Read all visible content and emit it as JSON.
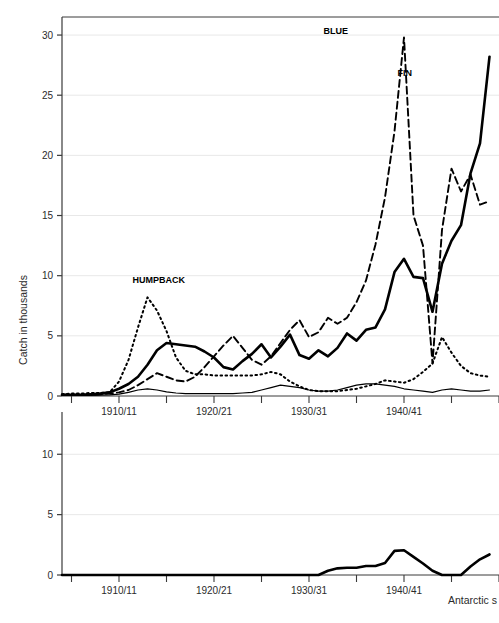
{
  "chart_data": {
    "type": "line",
    "title": "",
    "xlabel": "Antarctic s",
    "ylabel": "Catch in thousands",
    "grid": true,
    "legend_position": "inline-annotations",
    "panels": [
      {
        "name": "upper-panel",
        "ylim": [
          0,
          31.5
        ],
        "yticks": [
          0,
          5,
          10,
          15,
          20,
          25,
          30
        ],
        "ytick_labels": [
          "0",
          "5",
          "10",
          "15",
          "20",
          "25",
          "30"
        ],
        "xlim": [
          1904,
          1950
        ],
        "xticks": [
          1905,
          1910,
          1915,
          1920,
          1925,
          1930,
          1935,
          1940,
          1945,
          1950
        ],
        "xtick_labels": [
          "",
          "1910/11",
          "",
          "1920/21",
          "",
          "1930/31",
          "",
          "1940/41",
          "",
          ""
        ],
        "annotations": [
          {
            "text": "HUMPBACK",
            "x": 1911.0,
            "y": 9.4
          },
          {
            "text": "BLUE",
            "x": 1931.1,
            "y": 30.1
          },
          {
            "text": "FIN",
            "x": 1938.9,
            "y": 26.6
          }
        ],
        "series": [
          {
            "name": "BLUE",
            "style": "dashed",
            "x": [
              1904,
              1905,
              1906,
              1907,
              1908,
              1909,
              1910,
              1911,
              1912,
              1913,
              1914,
              1915,
              1916,
              1917,
              1918,
              1919,
              1920,
              1921,
              1922,
              1923,
              1924,
              1925,
              1926,
              1927,
              1928,
              1929,
              1930,
              1931,
              1932,
              1933,
              1934,
              1935,
              1936,
              1937,
              1938,
              1939,
              1940,
              1941,
              1942,
              1943,
              1944,
              1945,
              1946,
              1947,
              1948,
              1949
            ],
            "values": [
              0.1,
              0.1,
              0.1,
              0.1,
              0.15,
              0.2,
              0.3,
              0.5,
              0.9,
              1.4,
              1.9,
              1.6,
              1.3,
              1.2,
              1.6,
              2.4,
              3.3,
              4.2,
              5.0,
              4.0,
              3.0,
              2.6,
              3.3,
              4.4,
              5.5,
              6.3,
              4.9,
              5.3,
              6.5,
              6.0,
              6.5,
              7.8,
              9.6,
              12.6,
              16.5,
              22.0,
              29.8,
              15.0,
              12.5,
              2.7,
              13.8,
              18.9,
              17.0,
              18.4,
              15.9,
              16.2
            ]
          },
          {
            "name": "FIN",
            "style": "solid-thick",
            "x": [
              1904,
              1905,
              1906,
              1907,
              1908,
              1909,
              1910,
              1911,
              1912,
              1913,
              1914,
              1915,
              1916,
              1917,
              1918,
              1919,
              1920,
              1921,
              1922,
              1923,
              1924,
              1925,
              1926,
              1927,
              1928,
              1929,
              1930,
              1931,
              1932,
              1933,
              1934,
              1935,
              1936,
              1937,
              1938,
              1939,
              1940,
              1941,
              1942,
              1943,
              1944,
              1945,
              1946,
              1947,
              1948,
              1949
            ],
            "values": [
              0.1,
              0.1,
              0.1,
              0.15,
              0.2,
              0.3,
              0.6,
              1.0,
              1.6,
              2.6,
              3.8,
              4.4,
              4.3,
              4.2,
              4.1,
              3.7,
              3.2,
              2.4,
              2.2,
              2.9,
              3.5,
              4.3,
              3.2,
              4.1,
              5.1,
              3.4,
              3.1,
              3.8,
              3.3,
              4.0,
              5.2,
              4.6,
              5.5,
              5.7,
              7.2,
              10.3,
              11.4,
              9.9,
              9.8,
              7.0,
              11.0,
              12.9,
              14.2,
              18.5,
              21.0,
              28.2
            ]
          },
          {
            "name": "HUMPBACK",
            "style": "dotted",
            "x": [
              1904,
              1905,
              1906,
              1907,
              1908,
              1909,
              1910,
              1911,
              1912,
              1913,
              1914,
              1915,
              1916,
              1917,
              1918,
              1919,
              1920,
              1921,
              1922,
              1923,
              1924,
              1925,
              1926,
              1927,
              1928,
              1929,
              1930,
              1931,
              1932,
              1933,
              1934,
              1935,
              1936,
              1937,
              1938,
              1939,
              1940,
              1941,
              1942,
              1943,
              1944,
              1945,
              1946,
              1947,
              1948,
              1949
            ],
            "values": [
              0.15,
              0.2,
              0.2,
              0.25,
              0.25,
              0.3,
              1.2,
              3.0,
              5.7,
              8.2,
              7.1,
              5.4,
              3.2,
              2.1,
              1.8,
              1.8,
              1.7,
              1.7,
              1.7,
              1.7,
              1.7,
              1.8,
              2.0,
              1.8,
              1.2,
              0.8,
              0.5,
              0.4,
              0.4,
              0.4,
              0.5,
              0.6,
              0.8,
              1.0,
              1.3,
              1.2,
              1.1,
              1.4,
              2.0,
              2.7,
              4.9,
              3.6,
              2.5,
              1.9,
              1.7,
              1.6
            ]
          },
          {
            "name": "OTHER",
            "style": "solid-thin",
            "x": [
              1904,
              1905,
              1906,
              1907,
              1908,
              1909,
              1910,
              1911,
              1912,
              1913,
              1914,
              1915,
              1916,
              1917,
              1918,
              1919,
              1920,
              1921,
              1922,
              1923,
              1924,
              1925,
              1926,
              1927,
              1928,
              1929,
              1930,
              1931,
              1932,
              1933,
              1934,
              1935,
              1936,
              1937,
              1938,
              1939,
              1940,
              1941,
              1942,
              1943,
              1944,
              1945,
              1946,
              1947,
              1948,
              1949
            ],
            "values": [
              0.05,
              0.05,
              0.05,
              0.05,
              0.08,
              0.1,
              0.15,
              0.3,
              0.5,
              0.6,
              0.5,
              0.35,
              0.25,
              0.2,
              0.2,
              0.2,
              0.2,
              0.2,
              0.2,
              0.25,
              0.3,
              0.5,
              0.7,
              0.9,
              0.8,
              0.7,
              0.5,
              0.4,
              0.4,
              0.5,
              0.7,
              0.9,
              1.0,
              1.0,
              0.9,
              0.8,
              0.6,
              0.5,
              0.4,
              0.3,
              0.5,
              0.6,
              0.5,
              0.4,
              0.4,
              0.5
            ]
          }
        ]
      },
      {
        "name": "lower-panel",
        "ylim": [
          0,
          13.5
        ],
        "yticks": [
          0,
          5,
          10
        ],
        "ytick_labels": [
          "0",
          "5",
          "10"
        ],
        "xlim": [
          1904,
          1950
        ],
        "xticks": [
          1905,
          1910,
          1915,
          1920,
          1925,
          1930,
          1935,
          1940,
          1945,
          1950
        ],
        "xtick_labels": [
          "",
          "1910/11",
          "",
          "1920/21",
          "",
          "1930/31",
          "",
          "1940/41",
          "",
          ""
        ],
        "annotations": [],
        "series": [
          {
            "name": "SEI",
            "style": "solid-thick",
            "x": [
              1904,
              1905,
              1906,
              1907,
              1908,
              1909,
              1910,
              1911,
              1912,
              1913,
              1914,
              1915,
              1916,
              1917,
              1918,
              1919,
              1920,
              1921,
              1922,
              1923,
              1924,
              1925,
              1926,
              1927,
              1928,
              1929,
              1930,
              1931,
              1932,
              1933,
              1934,
              1935,
              1936,
              1937,
              1938,
              1939,
              1940,
              1941,
              1942,
              1943,
              1944,
              1945,
              1946,
              1947,
              1948,
              1949
            ],
            "values": [
              0,
              0,
              0,
              0,
              0,
              0,
              0,
              0,
              0,
              0,
              0,
              0,
              0,
              0,
              0,
              0,
              0,
              0,
              0,
              0,
              0,
              0,
              0,
              0,
              0,
              0,
              0,
              0,
              0.35,
              0.55,
              0.6,
              0.6,
              0.75,
              0.75,
              1.0,
              2.0,
              2.05,
              1.5,
              0.95,
              0.35,
              0,
              0,
              0,
              0.7,
              1.3,
              1.7
            ]
          }
        ]
      }
    ]
  },
  "colors": {
    "line": "#000000",
    "axis": "#3a3a3a",
    "grid": "#e8e8e8",
    "background": "#ffffff",
    "text": "#2b2b2b"
  }
}
